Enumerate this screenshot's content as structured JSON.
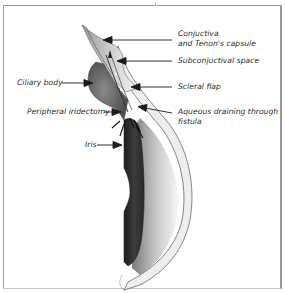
{
  "figure": {
    "type": "anatomical-cross-section"
  },
  "labels": {
    "conjunctiva_line1": "Conjuctiva",
    "conjunctiva_line2": "and Tenon's capsule",
    "subconjunctival": "Subconjuctival space",
    "ciliary_body": "Ciliary body",
    "scleral_flap": "Scleral flap",
    "peripheral_iridectomy": "Peripheral iridectomy",
    "aqueous_line1": "Aqueous draining through",
    "aqueous_line2": "fistula",
    "iris": "Iris"
  },
  "colors": {
    "border": "#9a9a9a",
    "text": "#2a2a2a",
    "arrow": "#1a1a1a",
    "iris_dark": "#2e2e2e",
    "tissue_gray": "#8a8a8a",
    "cornea_fill": "#eeeeee"
  }
}
